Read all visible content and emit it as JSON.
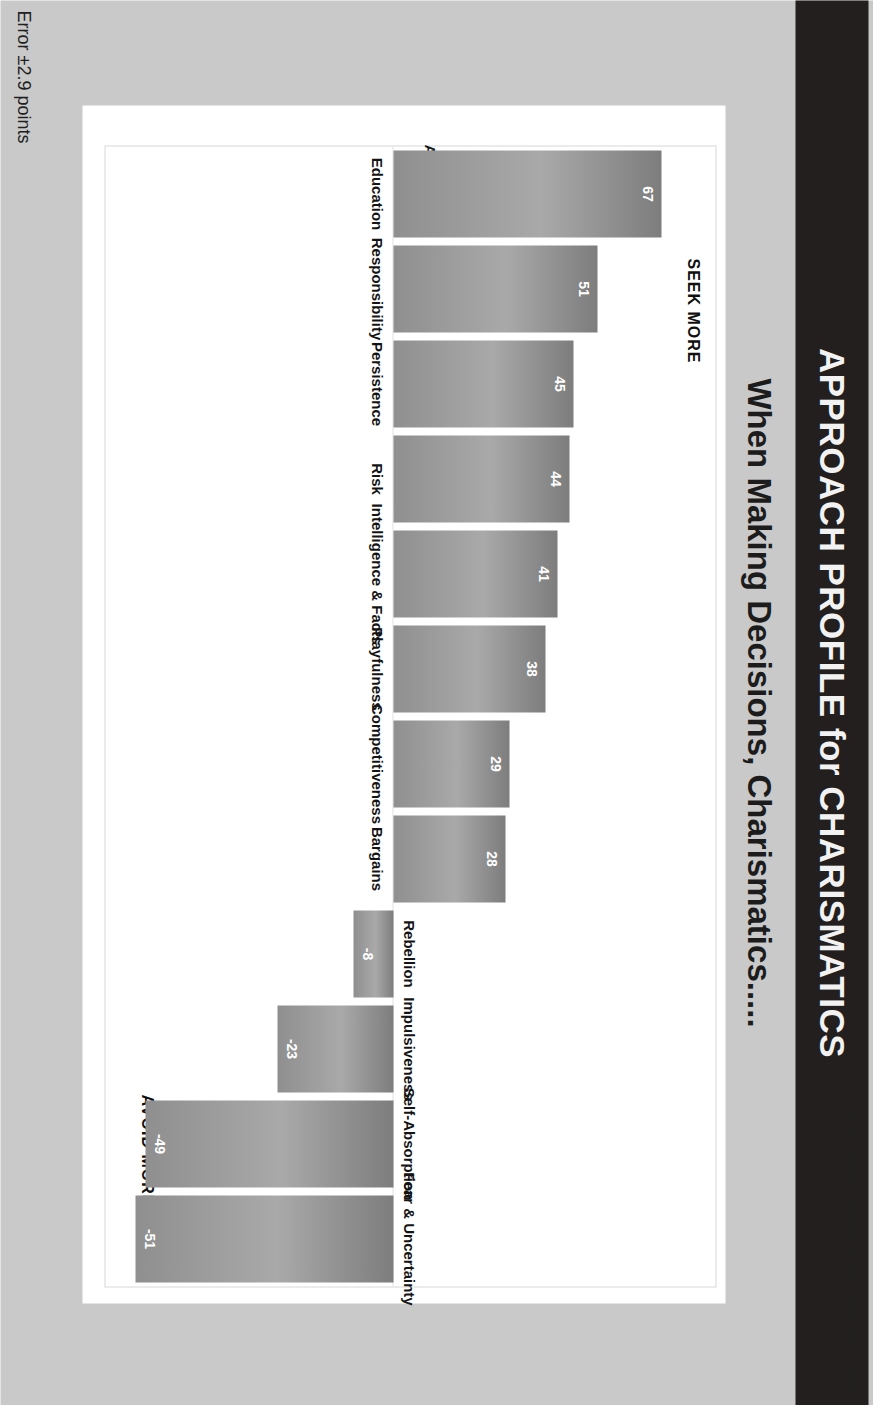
{
  "slide": {
    "banner_title": "APPROACH PROFILE for CHARISMATICS",
    "subtitle": "When Making Decisions, Charismatics.....",
    "footer_left": "Error ±2.9 points",
    "footer_right": "© 2003 Miller-Williams Inc. (millwill.com)"
  },
  "colors": {
    "banner_background": "#231f1e",
    "banner_text": "#f2f2f2",
    "slide_background": "#c9c9c9",
    "card_background": "#ffffff",
    "bar_fill": "#9a9a9a",
    "bar_label_text": "#ffffff"
  },
  "chart_data": {
    "type": "bar",
    "title": "When Making Decisions, Charismatics.....",
    "xlabel": "",
    "ylabel": "Average",
    "ylim": [
      -60,
      75
    ],
    "grid": false,
    "legend": "none",
    "annotations": [
      {
        "name": "seek-more",
        "text": "SEEK MORE"
      },
      {
        "name": "avoid-more",
        "text": "AVOID MORE"
      },
      {
        "name": "axis-name",
        "text": "Average"
      },
      {
        "name": "error",
        "text": "Error ±2.9 points"
      }
    ],
    "categories": [
      "Education",
      "Responsibility",
      "Persistence",
      "Risk",
      "Intelligence & Facts",
      "Playfulness",
      "Competitiveness",
      "Bargains",
      "Rebellion",
      "Impulsiveness",
      "Self-Absorption",
      "Fear & Uncertainty"
    ],
    "values": [
      67,
      51,
      45,
      44,
      41,
      38,
      29,
      28,
      -8,
      -23,
      -49,
      -51
    ],
    "value_labels": [
      "67",
      "51",
      "45",
      "44",
      "41",
      "38",
      "29",
      "28",
      "-8",
      "-23",
      "-49",
      "-51"
    ]
  }
}
